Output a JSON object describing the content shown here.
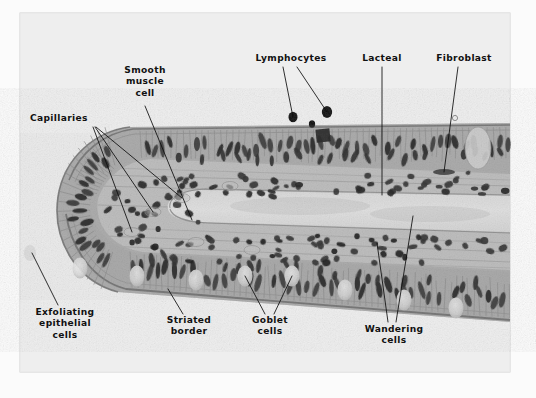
{
  "figure": {
    "kind": "histology-micrograph",
    "plate": {
      "background_color": "#e9e9e9",
      "page_color": "#fbfbfb",
      "border_color": "#cfcfcf",
      "x": 20,
      "y": 13,
      "width": 490,
      "height": 359
    },
    "label_color": "#111111",
    "leader_color": "#0d0d0d"
  },
  "labels": [
    {
      "id": "capillaries",
      "name": "Capillaries",
      "lines": [
        "Capillaries"
      ],
      "anchor_x": 30,
      "anchor_y": 121,
      "align": "start",
      "leaders": [
        [
          [
            93,
            127
          ],
          [
            132,
            232
          ]
        ],
        [
          [
            95,
            127
          ],
          [
            153,
            212
          ]
        ],
        [
          [
            96,
            127
          ],
          [
            182,
            198
          ]
        ]
      ]
    },
    {
      "id": "smooth-muscle-cell",
      "name": "Smooth muscle cell",
      "lines": [
        "Smooth",
        "muscle",
        "cell"
      ],
      "anchor_x": 145,
      "anchor_y": 73,
      "align": "middle",
      "leaders": [
        [
          [
            145,
            106
          ],
          [
            192,
            220
          ]
        ]
      ]
    },
    {
      "id": "lymphocytes",
      "name": "Lymphocytes",
      "lines": [
        "Lymphocytes"
      ],
      "anchor_x": 291,
      "anchor_y": 61,
      "align": "middle",
      "leaders": [
        [
          [
            283,
            67
          ],
          [
            293,
            117
          ]
        ],
        [
          [
            297,
            67
          ],
          [
            327,
            112
          ]
        ]
      ]
    },
    {
      "id": "lacteal",
      "name": "Lacteal",
      "lines": [
        "Lacteal"
      ],
      "anchor_x": 382,
      "anchor_y": 61,
      "align": "middle",
      "leaders": [
        [
          [
            382,
            67
          ],
          [
            382,
            195
          ]
        ]
      ]
    },
    {
      "id": "fibroblast",
      "name": "Fibroblast",
      "lines": [
        "Fibroblast"
      ],
      "anchor_x": 464,
      "anchor_y": 61,
      "align": "middle",
      "leaders": [
        [
          [
            458,
            67
          ],
          [
            444,
            172
          ]
        ]
      ]
    },
    {
      "id": "exfoliating-epithelial-cells",
      "name": "Exfoliating epithelial cells",
      "lines": [
        "Exfoliating",
        "epithelial",
        "cells"
      ],
      "anchor_x": 65,
      "anchor_y": 315,
      "align": "middle",
      "leaders": [
        [
          [
            58,
            305
          ],
          [
            32,
            253
          ]
        ]
      ]
    },
    {
      "id": "striated-border",
      "name": "Striated border",
      "lines": [
        "Striated",
        "border"
      ],
      "anchor_x": 189,
      "anchor_y": 323,
      "align": "middle",
      "leaders": [
        [
          [
            183,
            314
          ],
          [
            168,
            289
          ]
        ]
      ]
    },
    {
      "id": "goblet-cells",
      "name": "Goblet cells",
      "lines": [
        "Goblet",
        "cells"
      ],
      "anchor_x": 270,
      "anchor_y": 323,
      "align": "middle",
      "leaders": [
        [
          [
            265,
            314
          ],
          [
            245,
            276
          ]
        ],
        [
          [
            274,
            314
          ],
          [
            292,
            276
          ]
        ]
      ]
    },
    {
      "id": "wandering-cells",
      "name": "Wandering cells",
      "lines": [
        "Wandering",
        "cells"
      ],
      "anchor_x": 394,
      "anchor_y": 332,
      "align": "middle",
      "leaders": [
        [
          [
            388,
            322
          ],
          [
            377,
            243
          ]
        ],
        [
          [
            396,
            322
          ],
          [
            413,
            216
          ]
        ]
      ]
    }
  ]
}
